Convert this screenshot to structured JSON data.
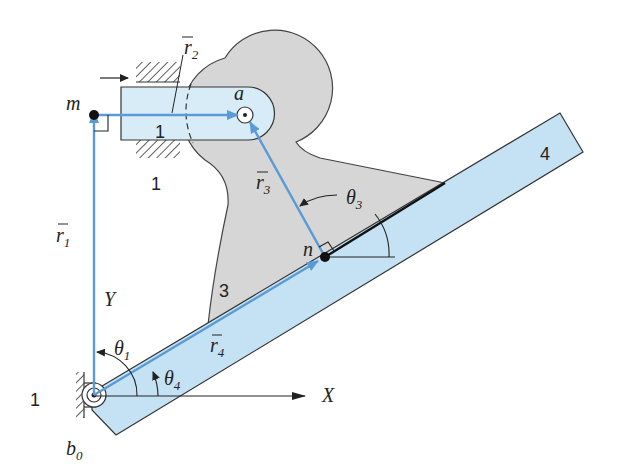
{
  "figure": {
    "type": "mechanism-kinematic-diagram",
    "colors": {
      "link_blue_fill": "#c4e2f4",
      "link_gray_fill": "#d6d6d6",
      "vector_blue": "#5b9bd5",
      "outline": "#333333"
    },
    "links": [
      {
        "id": "1",
        "label": "1",
        "description": "ground (slider guide)"
      },
      {
        "id": "1b",
        "label": "1",
        "description": "ground (pivot support)"
      },
      {
        "id": "2",
        "label": "2",
        "description": "slider"
      },
      {
        "id": "3",
        "label": "3",
        "description": "gray link"
      },
      {
        "id": "4",
        "label": "4",
        "description": "bar"
      }
    ],
    "points": {
      "m": "m",
      "a": "a",
      "n": "n",
      "b0": "b",
      "b0_sub": "0"
    },
    "vectors": {
      "r1": {
        "name": "r",
        "sub": "1"
      },
      "r2": {
        "name": "r",
        "sub": "2"
      },
      "r3": {
        "name": "r",
        "sub": "3"
      },
      "r4": {
        "name": "r",
        "sub": "4"
      }
    },
    "angles": {
      "theta1": {
        "name": "θ",
        "sub": "1"
      },
      "theta3": {
        "name": "θ",
        "sub": "3"
      },
      "theta4": {
        "name": "θ",
        "sub": "4"
      }
    },
    "axes": {
      "x": "X",
      "y": "Y"
    }
  }
}
